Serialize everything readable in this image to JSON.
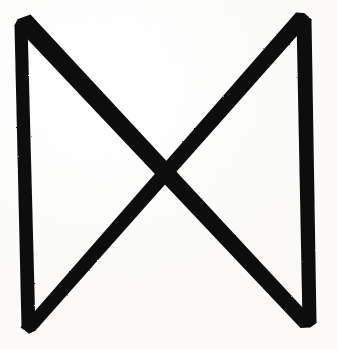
{
  "image": {
    "kind": "scanned-symbol",
    "subject": "bowtie-rune-mark",
    "description": "Hand-drawn bowtie / hourglass sigil formed by two near-vertical strokes joined by a large X of crossing diagonals",
    "width": 337,
    "height": 349,
    "ink_color": "#0d0d0d",
    "paper_color": "#fdfdfc",
    "stroke_style": "solid-filled-tapered"
  },
  "geometry": {
    "vertices": {
      "top_left": [
        18,
        19
      ],
      "top_right": [
        304,
        13
      ],
      "bottom_left": [
        29,
        333
      ],
      "bottom_right": [
        310,
        327
      ],
      "center_crossing": [
        165,
        175
      ]
    },
    "strokes": [
      {
        "name": "left-vertical",
        "from": [
          18,
          19
        ],
        "to": [
          29,
          333
        ],
        "width": 8
      },
      {
        "name": "right-vertical",
        "from": [
          304,
          13
        ],
        "to": [
          310,
          327
        ],
        "width": 9
      },
      {
        "name": "diagonal-top-left-to-bottom-right",
        "from": [
          18,
          19
        ],
        "to": [
          310,
          327
        ],
        "width": 12
      },
      {
        "name": "diagonal-top-right-to-bottom-left",
        "from": [
          304,
          13
        ],
        "to": [
          29,
          333
        ],
        "width": 12
      }
    ]
  },
  "paths": {
    "left_vertical": "M 18 19 L 27.5 24.5 L 35.5 330.5 L 29 333.5 L 21.5 327 L 14.5 25.5 Z",
    "right_vertical": "M 304 13 L 311.5 19.5 L 316.5 323 L 310 327.5 L 302.5 321.5 L 296.5 19.5 Z",
    "diagonal_a": "M 18 19 L 30.5 14.5 L 316.5 322.5 L 310 327.5 L 300.5 328 L 14.5 25.5 Z",
    "diagonal_b": "M 304 13 L 311.5 19.5 L 35.5 330.5 L 29 333.5 L 20.5 327.5 L 296 12.5 Z"
  }
}
